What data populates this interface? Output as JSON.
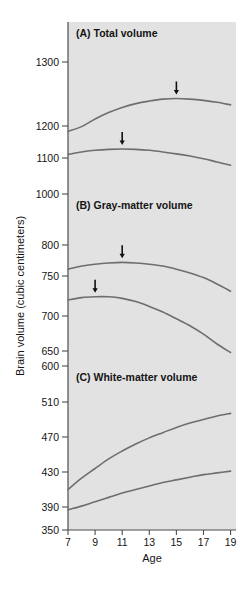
{
  "figure": {
    "background_color": "#ffffff",
    "panel_background_color": "#e2e2e2",
    "axis_color": "#4d4d4d",
    "curve_color": "#6e6e6e",
    "text_color": "#151515",
    "y_axis_label": "Brain volume (cubic centimeters)",
    "x_axis_label": "Age"
  },
  "chart_data": {
    "type": "line",
    "xlabel": "Age",
    "ylabel": "Brain volume (cubic centimeters)",
    "x": [
      7,
      8,
      9,
      10,
      11,
      12,
      13,
      14,
      15,
      16,
      17,
      18,
      19
    ],
    "xlim": [
      7,
      19.4
    ],
    "xticks": [
      7,
      9,
      11,
      13,
      15,
      17,
      19
    ],
    "xticklabels": [
      "7",
      "9",
      "11",
      "13",
      "15",
      "17",
      "19"
    ],
    "grid": false,
    "legend": "none",
    "annotations": [
      "Arrows mark the age at which each curve reaches peak volume."
    ],
    "panels": [
      {
        "id": "A",
        "title": "(A) Total volume",
        "ylim": [
          1000,
          1340
        ],
        "yticks": [
          1000,
          1100,
          1200,
          1300
        ],
        "yticklabels": [
          "1000",
          "1100",
          "1200",
          "1300"
        ],
        "series": [
          {
            "name": "upper-curve",
            "values": [
              1183,
              1198,
              1211,
              1221,
              1229,
              1235,
              1239,
              1242,
              1243,
              1242,
              1240,
              1237,
              1233
            ],
            "peak_age": 15,
            "peak_value": 1243,
            "arrow": true
          },
          {
            "name": "lower-curve",
            "values": [
              1111,
              1119,
              1124,
              1127,
              1128,
              1127,
              1124,
              1119,
              1113,
              1106,
              1098,
              1089,
              1080
            ],
            "peak_age": 11,
            "peak_value": 1128,
            "arrow": true
          }
        ]
      },
      {
        "id": "B",
        "title": "(B) Gray-matter volume",
        "ylim": [
          600,
          1000
        ],
        "yticks": [
          600,
          650,
          700,
          750,
          800,
          1000
        ],
        "yticklabels": [
          "600",
          "650",
          "700",
          "750",
          "800",
          "1000"
        ],
        "yaxis_note": "non-linear break between 800 and 1000",
        "series": [
          {
            "name": "upper-curve",
            "values": [
              761,
              766,
              769,
              771,
              772,
              771,
              769,
              766,
              761,
              755,
              748,
              740,
              731
            ],
            "peak_age": 11,
            "peak_value": 772,
            "arrow": true
          },
          {
            "name": "lower-curve",
            "values": [
              720,
              723,
              724,
              724,
              722,
              718,
              712,
              705,
              696,
              686,
              674,
              660,
              645
            ],
            "peak_age": 9,
            "peak_value": 724,
            "arrow": true
          }
        ]
      },
      {
        "id": "C",
        "title": "(C) White-matter volume",
        "ylim": [
          350,
          600
        ],
        "yticks": [
          350,
          390,
          430,
          470,
          510,
          600
        ],
        "yticklabels": [
          "350",
          "390",
          "430",
          "470",
          "510",
          "600"
        ],
        "yaxis_note": "non-linear break between 510 and 600",
        "series": [
          {
            "name": "upper-curve",
            "values": [
              410,
              423,
              434,
              445,
              454,
              462,
              469,
              475,
              481,
              486,
              490,
              494,
              497
            ],
            "arrow": false
          },
          {
            "name": "lower-curve",
            "values": [
              385,
              391,
              396,
              401,
              406,
              410,
              414,
              418,
              421,
              424,
              427,
              429,
              431
            ],
            "arrow": false
          }
        ]
      }
    ]
  }
}
